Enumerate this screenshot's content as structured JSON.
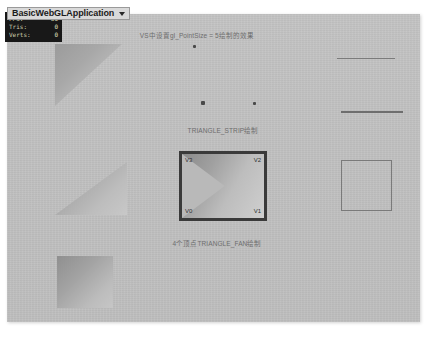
{
  "titlebar": {
    "app_name": "BasicWebGLApplication",
    "dropdown_icon": "chevron-down-icon"
  },
  "stats_overlay": {
    "rows": [
      {
        "key": "FPS:",
        "value": "60"
      },
      {
        "key": "Tris:",
        "value": "0"
      },
      {
        "key": "Verts:",
        "value": "0"
      }
    ]
  },
  "captions": {
    "points": "VS中设置gl_PointSize = 5绘制的效果",
    "triangle_strip": "TRIANGLE_STRIP绘制",
    "triangle_fan": "4个顶点TRIANGLE_FAN绘制"
  },
  "strip_box": {
    "vertices": {
      "v3": "V3",
      "v2": "V2",
      "v0": "V0",
      "v1": "V1"
    }
  },
  "colors": {
    "canvas_background": "#c0c0c0",
    "overlay_background": "#181818",
    "overlay_text": "#c9c9a8",
    "caption_text": "#6d6d6d",
    "highlight_border": "#3a3a3a",
    "titlebar_background": "#d9d9d9",
    "line_color": "#7b7b7b",
    "point_color": "#4a4a4a"
  }
}
